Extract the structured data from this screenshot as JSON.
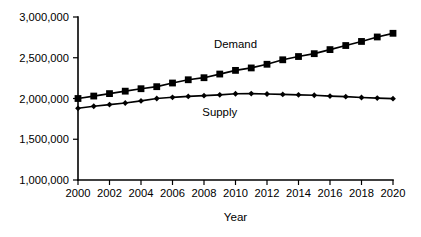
{
  "chart_data": {
    "type": "line",
    "title": "",
    "xlabel": "Year",
    "ylabel": "",
    "x": [
      2000,
      2001,
      2002,
      2003,
      2004,
      2005,
      2006,
      2007,
      2008,
      2009,
      2010,
      2011,
      2012,
      2013,
      2014,
      2015,
      2016,
      2017,
      2018,
      2019,
      2020
    ],
    "xtick_labels": [
      "2000",
      "2002",
      "2004",
      "2006",
      "2008",
      "2010",
      "2012",
      "2014",
      "2016",
      "2018",
      "2020"
    ],
    "xticks": [
      2000,
      2002,
      2004,
      2006,
      2008,
      2010,
      2012,
      2014,
      2016,
      2018,
      2020
    ],
    "xlim": [
      2000,
      2020
    ],
    "ytick_labels": [
      "1,000,000",
      "1,500,000",
      "2,000,000",
      "2,500,000",
      "3,000,000"
    ],
    "yticks": [
      1000000,
      1500000,
      2000000,
      2500000,
      3000000
    ],
    "ylim": [
      1000000,
      3000000
    ],
    "grid": false,
    "legend_position": "inline-annotation",
    "series": [
      {
        "name": "Demand",
        "marker": "square",
        "label_x": 2010,
        "label_y": 2620000,
        "values": [
          2000000,
          2030000,
          2060000,
          2090000,
          2120000,
          2145000,
          2190000,
          2230000,
          2255000,
          2300000,
          2345000,
          2375000,
          2420000,
          2475000,
          2515000,
          2550000,
          2600000,
          2650000,
          2700000,
          2755000,
          2800000
        ]
      },
      {
        "name": "Supply",
        "marker": "diamond",
        "label_x": 2009,
        "label_y": 1790000,
        "values": [
          1880000,
          1905000,
          1925000,
          1945000,
          1970000,
          2000000,
          2015000,
          2025000,
          2035000,
          2045000,
          2058000,
          2060000,
          2055000,
          2050000,
          2045000,
          2040000,
          2030000,
          2022000,
          2012000,
          2005000,
          1998000
        ]
      }
    ]
  },
  "axis": {
    "x_title": "Year"
  }
}
